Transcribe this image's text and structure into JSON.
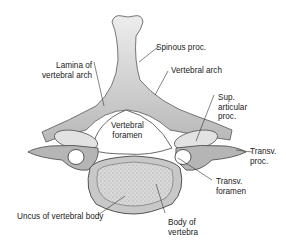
{
  "figure": {
    "labels": {
      "spinous_proc": "Spinous proc.",
      "lamina": "Lamina of\nvertebral arch",
      "vertebral_arch": "Vertebral arch",
      "sup_articular": "Sup.\narticular\nproc.",
      "vertebral_foramen": "Vertebral\nforamen",
      "transv_proc": "Transv.\nproc.",
      "transv_foramen": "Transv.\nforamen",
      "uncus": "Uncus of vertebral body",
      "body": "Body of\nvertebra"
    },
    "colors": {
      "bone_light": "#e6e6e6",
      "bone_mid": "#bdbdbd",
      "bone_dark": "#6f6f6f",
      "leader": "#333333",
      "text": "#222222"
    }
  }
}
